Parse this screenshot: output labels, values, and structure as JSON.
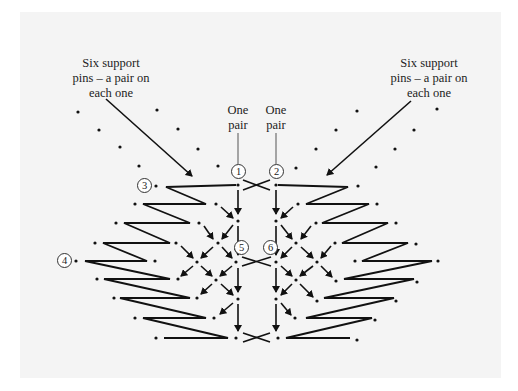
{
  "diagram": {
    "type": "bobbin lace working diagram",
    "colors": {
      "background": "#f4f4f4",
      "ink": "#111111",
      "page": "#ffffff"
    },
    "labels": {
      "support_left": [
        "Six support",
        "pins – a pair on",
        "each one"
      ],
      "support_right": [
        "Six support",
        "pins – a pair on",
        "each one"
      ],
      "pair_left": [
        "One",
        "pair"
      ],
      "pair_right": [
        "One",
        "pair"
      ]
    },
    "markers": [
      "1",
      "2",
      "3",
      "4",
      "5",
      "6"
    ]
  }
}
